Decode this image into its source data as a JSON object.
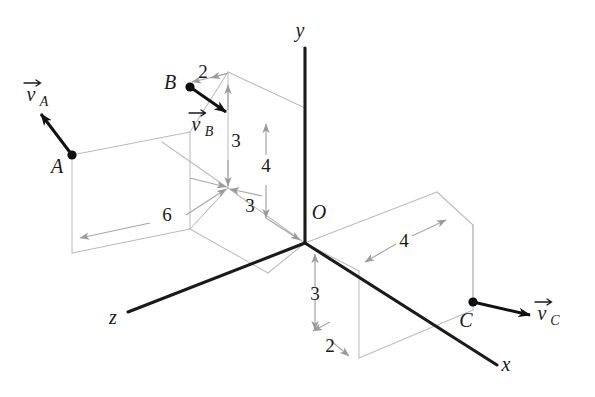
{
  "figure": {
    "background_color": "#ffffff",
    "axis_color": "#1a1a1a",
    "construction_color": "#bcbcbc",
    "dimension_color": "#a8a8a8"
  },
  "axes": [
    {
      "name": "y-axis",
      "label": "y"
    },
    {
      "name": "x-axis",
      "label": "x"
    },
    {
      "name": "z-axis",
      "label": "z"
    }
  ],
  "origin": {
    "label": "O"
  },
  "points": [
    {
      "name": "point-a",
      "label": "A"
    },
    {
      "name": "point-b",
      "label": "B"
    },
    {
      "name": "point-c",
      "label": "C"
    }
  ],
  "vectors": [
    {
      "name": "velocity-a",
      "symbol": "v",
      "subscript": "A"
    },
    {
      "name": "velocity-b",
      "symbol": "v",
      "subscript": "B"
    },
    {
      "name": "velocity-c",
      "symbol": "v",
      "subscript": "C"
    }
  ],
  "dimensions": [
    {
      "name": "dim-b-horizontal-top",
      "value": "2"
    },
    {
      "name": "dim-b-vertical",
      "value": "3"
    },
    {
      "name": "dim-b-depth",
      "value": "3"
    },
    {
      "name": "dim-y-height",
      "value": "4"
    },
    {
      "name": "dim-z-length",
      "value": "6"
    },
    {
      "name": "dim-x-length",
      "value": "4"
    },
    {
      "name": "dim-c-vertical",
      "value": "3"
    },
    {
      "name": "dim-c-depth",
      "value": "2"
    }
  ]
}
